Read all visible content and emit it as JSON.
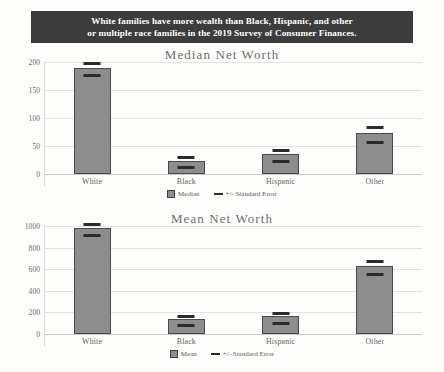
{
  "banner": {
    "line1": "White families have more wealth than Black, Hispanic, and other",
    "line2": "or multiple race families in the 2019 Survey of Consumer Finances.",
    "background": "#3c3c3c",
    "text_color": "#ffffff"
  },
  "colors": {
    "bar_fill": "#8d8d8d",
    "bar_border": "#4a4a4a",
    "error_bar": "#2b2b2b",
    "gridline": "#e3e3e3",
    "title_text": "#6e6e6e",
    "tick_text": "#6b6b6b"
  },
  "chart_data": [
    {
      "type": "bar",
      "title": "Median Net Worth",
      "xlabel": "",
      "ylabel": "",
      "categories": [
        "White",
        "Black",
        "Hispanic",
        "Other"
      ],
      "values": [
        190,
        24,
        36,
        74
      ],
      "error": [
        6,
        4,
        5,
        9
      ],
      "yticks": [
        0,
        50,
        100,
        150,
        200
      ],
      "ylim": [
        0,
        200
      ],
      "grid": true,
      "legend": [
        "Median",
        "+/- Standard Error"
      ],
      "legend_position": "bottom"
    },
    {
      "type": "bar",
      "title": "Mean Net Worth",
      "xlabel": "",
      "ylabel": "",
      "categories": [
        "White",
        "Black",
        "Hispanic",
        "Other"
      ],
      "values": [
        980,
        140,
        165,
        630
      ],
      "error": [
        28,
        18,
        22,
        35
      ],
      "yticks": [
        0,
        200,
        400,
        600,
        800,
        1000
      ],
      "ylim": [
        0,
        1000
      ],
      "grid": true,
      "legend": [
        "Mean",
        "+/- Standard Error"
      ],
      "legend_position": "bottom"
    }
  ]
}
